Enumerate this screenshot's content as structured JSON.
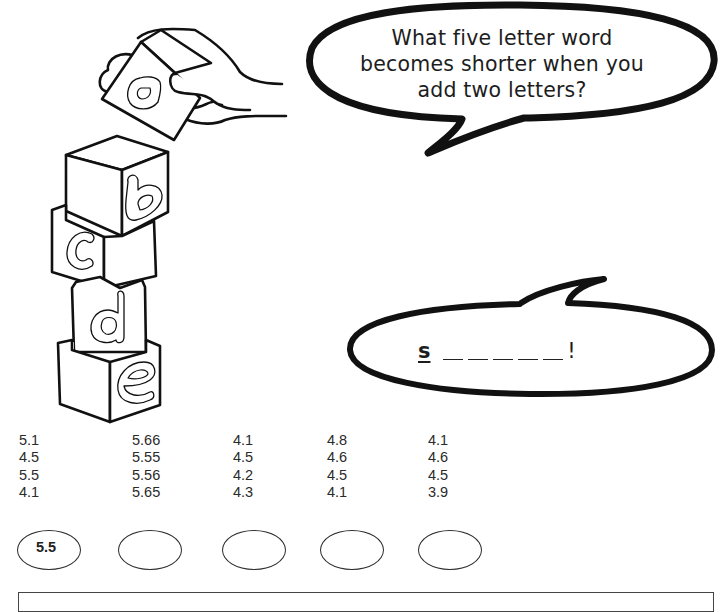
{
  "illustration": {
    "hand_block_letter": "a",
    "stacked_block_letters": [
      "b",
      "c",
      "d",
      "e"
    ]
  },
  "question_bubble": {
    "lines": [
      "What five letter word",
      "becomes shorter when you",
      "add two letters?"
    ]
  },
  "answer_bubble": {
    "first_letter": "s",
    "blank_count": 5,
    "end_mark": "!"
  },
  "number_columns": [
    {
      "values": [
        "5.1",
        "4.5",
        "5.5",
        "4.1"
      ],
      "answer": "5.5"
    },
    {
      "values": [
        "5.66",
        "5.55",
        "5.56",
        "5.65"
      ],
      "answer": ""
    },
    {
      "values": [
        "4.1",
        "4.5",
        "4.2",
        "4.3"
      ],
      "answer": ""
    },
    {
      "values": [
        "4.8",
        "4.6",
        "4.5",
        "4.1"
      ],
      "answer": ""
    },
    {
      "values": [
        "4.1",
        "4.6",
        "4.5",
        "3.9"
      ],
      "answer": ""
    }
  ],
  "colors": {
    "ink": "#1a1a1a",
    "paper": "#ffffff"
  }
}
